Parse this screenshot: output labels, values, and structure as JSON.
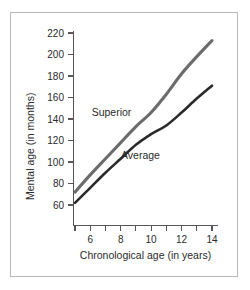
{
  "chart_data": {
    "type": "line",
    "title": "",
    "xlabel": "Chronological age (in years)",
    "ylabel": "Mental age (in months)",
    "xlim": [
      5,
      14
    ],
    "ylim": [
      50,
      225
    ],
    "grid": false,
    "legend": "inline-labels",
    "x": [
      5,
      6,
      7,
      8,
      9,
      10,
      11,
      12,
      13,
      14
    ],
    "xticks": [
      5,
      6,
      7,
      8,
      9,
      10,
      11,
      12,
      13,
      14
    ],
    "xticklabels": [
      "",
      "6",
      "",
      "8",
      "",
      "10",
      "",
      "12",
      "",
      "14"
    ],
    "yticks": [
      60,
      80,
      100,
      120,
      140,
      160,
      180,
      200,
      220
    ],
    "yticklabels": [
      "60",
      "80",
      "100",
      "120",
      "140",
      "160",
      "180",
      "200",
      "220"
    ],
    "series": [
      {
        "name": "Superior",
        "color": "#6b6b6b",
        "stroke_width": 3.1,
        "label_x": 7.4,
        "label_y": 143,
        "values": [
          72,
          88,
          103,
          118,
          133,
          146,
          163,
          182,
          198,
          213
        ]
      },
      {
        "name": "Average",
        "color": "#2a2a2a",
        "stroke_width": 2.6,
        "label_x": 9.3,
        "label_y": 103,
        "values": [
          62,
          76,
          90,
          103,
          116,
          126,
          134,
          146,
          159,
          171
        ]
      }
    ]
  },
  "colors": {
    "frame": "#b9b9b9",
    "axis": "#55555a",
    "text": "#2b2b2b",
    "background": "#ffffff",
    "superior": "#6b6b6b",
    "average": "#2a2a2a"
  }
}
